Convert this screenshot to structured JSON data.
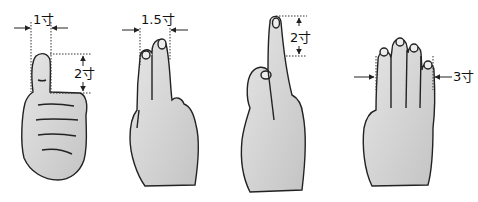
{
  "figure": {
    "colors": {
      "skin": "#cfcfcf",
      "skin_light": "#e4e4e4",
      "outline": "#222222",
      "guide": "#333333",
      "background": "#ffffff"
    },
    "panels": [
      {
        "id": "thumb",
        "measure_label": "1寸",
        "measure_label_2": "2寸",
        "gesture": "thumbs-up"
      },
      {
        "id": "two-fingers",
        "measure_label": "1.5寸",
        "gesture": "index-and-middle-fingers"
      },
      {
        "id": "one-finger",
        "measure_label": "2寸",
        "gesture": "crossed-middle-over-index"
      },
      {
        "id": "four-fingers",
        "measure_label": "3寸",
        "gesture": "four-fingers-together"
      }
    ]
  }
}
